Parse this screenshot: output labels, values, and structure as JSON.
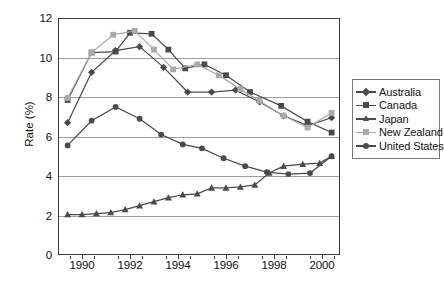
{
  "chart_data": {
    "type": "line",
    "title": "",
    "xlabel": "",
    "ylabel": "Rate (%)",
    "xlim": [
      1989.0,
      2000.75
    ],
    "ylim": [
      0,
      12
    ],
    "ytick_values": [
      0,
      2,
      4,
      6,
      8,
      10,
      12
    ],
    "ytick_labels": [
      "0",
      "2",
      "4",
      "6",
      "8",
      "10",
      "12"
    ],
    "xtick_values": [
      1990,
      1992,
      1994,
      1996,
      1998,
      2000
    ],
    "xtick_labels": [
      "1990",
      "1992",
      "1994",
      "1996",
      "1998",
      "2000"
    ],
    "xtick_minor_values": [
      1989.5,
      1990.5,
      1991.5,
      1992.5,
      1993.5,
      1994.5,
      1995.5,
      1996.5,
      1997.5,
      1998.5,
      1999.5,
      2000.5
    ],
    "grid": "horizontal",
    "legend_position": "right",
    "x": [
      1989.4,
      1990.4,
      1991.4,
      1992.4,
      1993.4,
      1994.4,
      1995.4,
      1996.4,
      1997.4,
      1998.4,
      1999.4,
      2000.4
    ],
    "series": [
      {
        "name": "Australia",
        "marker": "diamond",
        "color": "#4a4a4a",
        "values": [
          6.7,
          9.25,
          10.35,
          10.55,
          9.5,
          8.25,
          8.25,
          8.35,
          7.75,
          7.05,
          6.55,
          6.95
        ]
      },
      {
        "name": "Canada",
        "marker": "square",
        "color": "#4a4a4a",
        "values": [
          7.85,
          10.25,
          10.3,
          11.25,
          11.2,
          10.4,
          9.45,
          9.65,
          9.1,
          8.25,
          7.55,
          6.75
        ]
      },
      {
        "name": "Japan",
        "marker": "triangle",
        "color": "#4a4a4a",
        "values": [
          2.05,
          2.05,
          2.15,
          2.5,
          2.9,
          3.1,
          3.4,
          3.4,
          3.55,
          4.5,
          4.65,
          4.65
        ]
      },
      {
        "name": "New Zealand",
        "marker": "square",
        "color": "#aaaaaa",
        "values": [
          7.95,
          10.25,
          11.15,
          11.35,
          10.4,
          9.4,
          9.65,
          9.1,
          7.8,
          7.05,
          6.45,
          7.2
        ]
      },
      {
        "name": "United States",
        "marker": "circle",
        "color": "#4a4a4a",
        "values": [
          5.55,
          6.8,
          7.5,
          6.9,
          6.1,
          5.6,
          5.4,
          4.9,
          4.5,
          4.2,
          4.1,
          5.0
        ]
      }
    ],
    "series_dense": [
      {
        "name": "Australia",
        "marker": "diamond",
        "color": "#4a4a4a",
        "points": [
          [
            1989.4,
            6.7
          ],
          [
            1990.4,
            9.25
          ],
          [
            1991.4,
            10.35
          ],
          [
            1992.4,
            10.55
          ],
          [
            1993.4,
            9.5
          ],
          [
            1994.4,
            8.25
          ],
          [
            1995.4,
            8.25
          ],
          [
            1996.4,
            8.35
          ],
          [
            1997.4,
            7.75
          ],
          [
            1998.4,
            7.05
          ],
          [
            1999.4,
            6.55
          ],
          [
            2000.4,
            6.95
          ]
        ]
      },
      {
        "name": "Canada",
        "marker": "square",
        "color": "#4a4a4a",
        "points": [
          [
            1989.4,
            7.85
          ],
          [
            1990.4,
            10.25
          ],
          [
            1991.4,
            10.3
          ],
          [
            1992.0,
            11.25
          ],
          [
            1992.9,
            11.2
          ],
          [
            1993.6,
            10.4
          ],
          [
            1994.3,
            9.45
          ],
          [
            1995.1,
            9.65
          ],
          [
            1996.0,
            9.1
          ],
          [
            1997.0,
            8.25
          ],
          [
            1998.3,
            7.55
          ],
          [
            1999.4,
            6.75
          ],
          [
            2000.4,
            6.2
          ]
        ]
      },
      {
        "name": "Japan",
        "marker": "triangle",
        "color": "#4a4a4a",
        "points": [
          [
            1989.4,
            2.05
          ],
          [
            1990.0,
            2.05
          ],
          [
            1990.6,
            2.1
          ],
          [
            1991.2,
            2.15
          ],
          [
            1991.8,
            2.3
          ],
          [
            1992.4,
            2.5
          ],
          [
            1993.0,
            2.7
          ],
          [
            1993.6,
            2.9
          ],
          [
            1994.2,
            3.05
          ],
          [
            1994.8,
            3.1
          ],
          [
            1995.4,
            3.4
          ],
          [
            1996.0,
            3.4
          ],
          [
            1996.6,
            3.45
          ],
          [
            1997.2,
            3.55
          ],
          [
            1997.8,
            4.15
          ],
          [
            1998.4,
            4.5
          ],
          [
            1999.2,
            4.6
          ],
          [
            1999.9,
            4.65
          ],
          [
            2000.4,
            5.0
          ]
        ]
      },
      {
        "name": "New Zealand",
        "marker": "square",
        "color": "#aaaaaa",
        "points": [
          [
            1989.4,
            7.95
          ],
          [
            1990.4,
            10.25
          ],
          [
            1991.3,
            11.15
          ],
          [
            1992.2,
            11.35
          ],
          [
            1993.0,
            10.4
          ],
          [
            1993.8,
            9.4
          ],
          [
            1994.8,
            9.65
          ],
          [
            1995.7,
            9.1
          ],
          [
            1996.6,
            8.4
          ],
          [
            1997.4,
            7.8
          ],
          [
            1998.4,
            7.05
          ],
          [
            1999.4,
            6.45
          ],
          [
            2000.4,
            7.2
          ]
        ]
      },
      {
        "name": "United States",
        "marker": "circle",
        "color": "#4a4a4a",
        "points": [
          [
            1989.4,
            5.55
          ],
          [
            1990.4,
            6.8
          ],
          [
            1991.4,
            7.5
          ],
          [
            1992.4,
            6.9
          ],
          [
            1993.3,
            6.1
          ],
          [
            1994.2,
            5.6
          ],
          [
            1995.0,
            5.4
          ],
          [
            1995.9,
            4.9
          ],
          [
            1996.8,
            4.5
          ],
          [
            1997.7,
            4.2
          ],
          [
            1998.6,
            4.1
          ],
          [
            1999.5,
            4.15
          ],
          [
            2000.4,
            5.0
          ]
        ]
      }
    ]
  },
  "legend": {
    "items": [
      {
        "label": "Australia",
        "marker": "diamond",
        "color": "#4a4a4a"
      },
      {
        "label": "Canada",
        "marker": "square",
        "color": "#4a4a4a"
      },
      {
        "label": "Japan",
        "marker": "triangle",
        "color": "#4a4a4a"
      },
      {
        "label": "New Zealand",
        "marker": "square",
        "color": "#aaaaaa"
      },
      {
        "label": "United States",
        "marker": "circle",
        "color": "#4a4a4a"
      }
    ]
  },
  "colors": {
    "axis": "#3a3a3a",
    "gridline": "#9d9d9d",
    "dark_series": "#4a4a4a",
    "light_series": "#aaaaaa",
    "text": "#111111",
    "background": "#ffffff"
  }
}
